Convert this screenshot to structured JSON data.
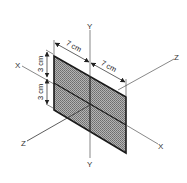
{
  "diagram": {
    "axes": {
      "y_top": "Y",
      "y_bottom": "Y",
      "x_left": "X",
      "x_right": "X",
      "z_left": "Z",
      "z_right": "Z"
    },
    "dimensions": {
      "width_left": "7 cm",
      "width_right": "7 cm",
      "height_top": "3 cm",
      "height_bottom": "3 cm"
    },
    "colors": {
      "sheet_fill": "#9a9a9a",
      "outline": "#1a1a1a",
      "axis_line": "#555555",
      "background": "#ffffff"
    }
  }
}
